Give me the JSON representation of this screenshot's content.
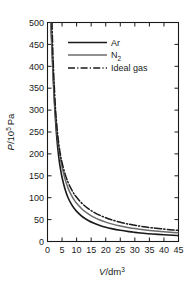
{
  "chart_data": {
    "type": "line",
    "title": "",
    "xlabel": "V/dm3",
    "xlabel_parts": {
      "var": "V",
      "slash": "/dm",
      "exp": "3"
    },
    "ylabel": "P/105 Pa",
    "ylabel_parts": {
      "var": "P",
      "slash": "/10",
      "exp": "5",
      "unit": " Pa"
    },
    "xlim": [
      0,
      45
    ],
    "ylim": [
      0,
      500
    ],
    "xticks": [
      0,
      5,
      10,
      15,
      20,
      25,
      30,
      35,
      40,
      45
    ],
    "yticks": [
      0,
      50,
      100,
      150,
      200,
      250,
      300,
      350,
      400,
      450,
      500
    ],
    "xtick_labels": [
      "0",
      "5",
      "10",
      "15",
      "20",
      "25",
      "30",
      "35",
      "40",
      "45"
    ],
    "ytick_labels": [
      "0",
      "50",
      "100",
      "150",
      "200",
      "250",
      "300",
      "350",
      "400",
      "450",
      "500"
    ],
    "grid": false,
    "frame": "box",
    "tick_direction": "in",
    "legend_position": "upper-center",
    "series": [
      {
        "name": "Ar",
        "color": "#1a1a1a",
        "style": "solid",
        "width": 1.6,
        "x": [
          1.2,
          1.5,
          1.8,
          2.1,
          2.5,
          3.0,
          3.5,
          4.0,
          4.5,
          5.0,
          6.0,
          7.0,
          8.0,
          9.0,
          10.0,
          12.0,
          14.0,
          16.0,
          18.0,
          20.0,
          22.0,
          25.0,
          28.0,
          30.0,
          33.0,
          36.0,
          40.0,
          43.0,
          45.0
        ],
        "y": [
          500,
          450,
          400,
          355,
          305,
          253,
          215,
          186,
          164,
          146,
          120,
          101,
          87.5,
          77.0,
          68.8,
          56.5,
          47.9,
          41.5,
          36.6,
          32.6,
          29.4,
          25.5,
          22.5,
          20.9,
          18.8,
          17.1,
          15.3,
          14.1,
          13.5
        ]
      },
      {
        "name": "N2",
        "color": "#6b6b6b",
        "style": "solid",
        "width": 1.5,
        "x": [
          1.1,
          1.4,
          1.7,
          2.0,
          2.4,
          2.8,
          3.2,
          3.6,
          4.0,
          4.5,
          5.0,
          6.0,
          7.0,
          8.0,
          9.0,
          10.0,
          12.0,
          14.0,
          16.0,
          18.0,
          20.0,
          22.0,
          25.0,
          28.0,
          30.0,
          33.0,
          36.0,
          40.0,
          43.0,
          45.0
        ],
        "y": [
          500,
          455,
          415,
          372,
          322,
          285,
          254,
          229,
          208,
          187,
          170,
          143,
          123,
          108,
          96.5,
          87.2,
          73.0,
          62.8,
          55.1,
          49.1,
          44.2,
          40.2,
          35.4,
          31.6,
          29.5,
          26.8,
          24.6,
          22.1,
          20.6,
          19.7
        ]
      },
      {
        "name": "Ideal gas",
        "color": "#1a1a1a",
        "style": "dashdot",
        "width": 1.5,
        "x": [
          1.55,
          1.8,
          2.1,
          2.4,
          2.8,
          3.2,
          3.6,
          4.0,
          4.5,
          5.0,
          6.0,
          7.0,
          8.0,
          9.0,
          10.0,
          12.0,
          14.0,
          16.0,
          18.0,
          20.0,
          22.0,
          25.0,
          28.0,
          30.0,
          33.0,
          36.0,
          40.0,
          43.0,
          45.0
        ],
        "y": [
          500,
          440,
          388,
          345,
          298,
          265,
          238,
          217,
          196,
          180,
          155,
          136,
          122,
          110,
          101,
          86.0,
          75.0,
          66.5,
          59.8,
          54.3,
          49.6,
          44.0,
          39.5,
          37.0,
          33.8,
          31.2,
          28.3,
          26.4,
          25.3
        ]
      }
    ],
    "legend_entries": [
      {
        "label": "Ar",
        "color": "#1a1a1a",
        "style": "solid"
      },
      {
        "label": "N2",
        "color": "#6b6b6b",
        "style": "solid"
      },
      {
        "label": "Ideal gas",
        "color": "#1a1a1a",
        "style": "dashdot"
      }
    ]
  },
  "legend": {
    "item_ar": "Ar",
    "item_n2_base": "N",
    "item_n2_sub": "2",
    "item_ideal": "Ideal gas"
  },
  "axes": {
    "y_var": "P",
    "y_mid": "/10",
    "y_sup": "5",
    "y_unit": "Pa",
    "x_var": "V",
    "x_mid": "/dm",
    "x_sup": "3"
  },
  "colors": {
    "background": "#ffffff",
    "frame": "#1a1a1a",
    "ar": "#1a1a1a",
    "n2": "#6b6b6b",
    "ideal": "#1a1a1a"
  }
}
